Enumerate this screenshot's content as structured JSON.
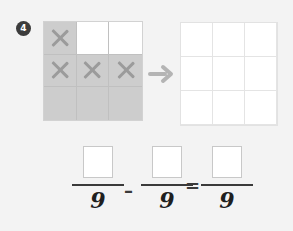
{
  "question": {
    "number": "4"
  },
  "icons": {
    "arrow": "arrow-right-icon",
    "x_mark": "x-mark-icon"
  },
  "colors": {
    "background": "#f3f3f3",
    "shaded_cell": "#cdcdcd",
    "x_mark": "#9b9b9b",
    "arrow": "#b4b4b4",
    "grid_line": "#d9d9d9",
    "text": "#1f1f1f",
    "badge": "#3c3c3c"
  },
  "left_grid": {
    "rows": 3,
    "cols": 3,
    "cells": [
      {
        "shaded": true,
        "mark": "X"
      },
      {
        "shaded": false,
        "mark": ""
      },
      {
        "shaded": false,
        "mark": ""
      },
      {
        "shaded": true,
        "mark": "X"
      },
      {
        "shaded": true,
        "mark": "X"
      },
      {
        "shaded": true,
        "mark": "X"
      },
      {
        "shaded": true,
        "mark": ""
      },
      {
        "shaded": true,
        "mark": ""
      },
      {
        "shaded": true,
        "mark": ""
      }
    ]
  },
  "right_grid": {
    "rows": 3,
    "cols": 3,
    "cells": [
      {
        "shaded": false,
        "mark": ""
      },
      {
        "shaded": false,
        "mark": ""
      },
      {
        "shaded": false,
        "mark": ""
      },
      {
        "shaded": false,
        "mark": ""
      },
      {
        "shaded": false,
        "mark": ""
      },
      {
        "shaded": false,
        "mark": ""
      },
      {
        "shaded": false,
        "mark": ""
      },
      {
        "shaded": false,
        "mark": ""
      },
      {
        "shaded": false,
        "mark": ""
      }
    ]
  },
  "equation": {
    "fractions": [
      {
        "numerator": "",
        "denominator": "9"
      },
      {
        "numerator": "",
        "denominator": "9"
      },
      {
        "numerator": "",
        "denominator": "9"
      }
    ],
    "operator_minus": "–",
    "operator_equals": "=",
    "numerator_placeholder": ""
  }
}
